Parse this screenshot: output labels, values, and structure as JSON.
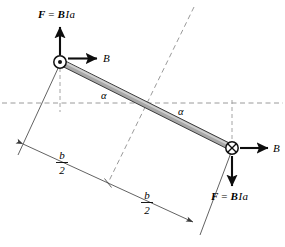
{
  "figure": {
    "type": "physics-diagram",
    "background_color": "#ffffff",
    "width": 285,
    "height": 247
  },
  "labels": {
    "force_top": {
      "text": "F = BIa",
      "parts": {
        "f": "F",
        "eq": "=",
        "b": "B",
        "i": "I",
        "a": "a"
      }
    },
    "force_bottom": {
      "text": "F = BIa",
      "parts": {
        "f": "F",
        "eq": "=",
        "b": "B",
        "i": "I",
        "a": "a"
      }
    },
    "field_top": {
      "text": "B"
    },
    "field_bottom": {
      "text": "B"
    },
    "angle_upper": {
      "text": "α"
    },
    "angle_lower": {
      "text": "α"
    },
    "dimension_left": {
      "numerator": "b",
      "denominator": "2"
    },
    "dimension_right": {
      "numerator": "b",
      "denominator": "2"
    }
  },
  "symbols": {
    "current_out_of_page": {
      "name": "circle-dot-icon",
      "meaning": "current out of page"
    },
    "current_into_page": {
      "name": "circle-x-icon",
      "meaning": "current into page"
    }
  },
  "colors": {
    "bar_fill": "#a8a8a8",
    "bar_highlight": "#cfcfcf",
    "bar_stroke": "#2b2b2b",
    "dashed_line": "#8e8e8e",
    "thin_line": "#3a3a3a",
    "arrow": "#0d0d0d",
    "text": "#000000"
  },
  "geometry": {
    "bar_start": {
      "x": 60,
      "y": 62
    },
    "bar_end": {
      "x": 232,
      "y": 148
    },
    "bar_midpoint": {
      "x": 146,
      "y": 105
    },
    "horizontal_axis_y": 103,
    "dimension_left_end": {
      "x": 23,
      "y": 144
    },
    "dimension_mid": {
      "x": 108,
      "y": 183
    },
    "dimension_right_end": {
      "x": 193,
      "y": 222
    }
  }
}
